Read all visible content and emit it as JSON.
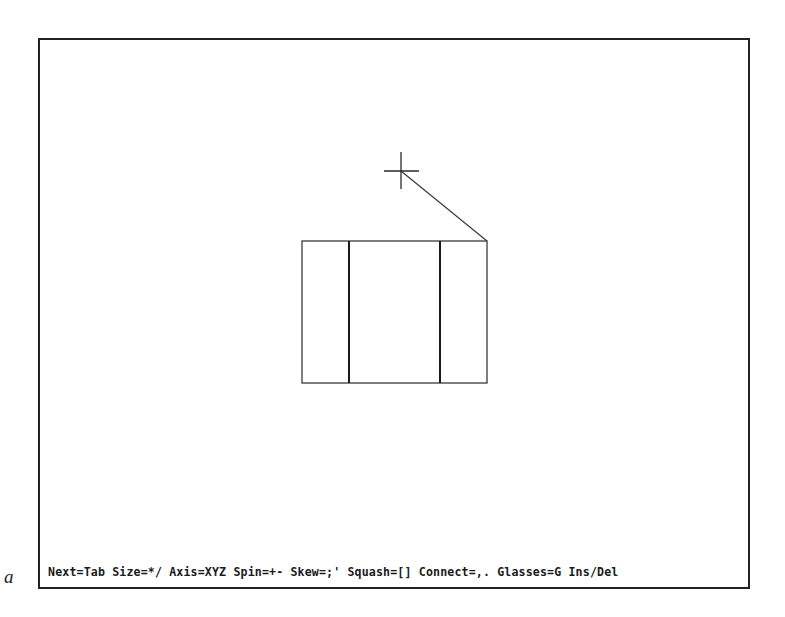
{
  "figure": {
    "label": "a"
  },
  "status_bar": {
    "text": "Next=Tab Size=*/ Axis=XYZ Spin=+- Skew=;' Squash=[] Connect=,. Glasses=G Ins/Del",
    "commands": [
      {
        "action": "Next",
        "keys": "Tab"
      },
      {
        "action": "Size",
        "keys": "*/"
      },
      {
        "action": "Axis",
        "keys": "XYZ"
      },
      {
        "action": "Spin",
        "keys": "+-"
      },
      {
        "action": "Skew",
        "keys": ";'"
      },
      {
        "action": "Squash",
        "keys": "[]"
      },
      {
        "action": "Connect",
        "keys": ",."
      },
      {
        "action": "Glasses",
        "keys": "G"
      },
      {
        "action": "Ins/Del",
        "keys": ""
      }
    ]
  },
  "scene": {
    "cursor": {
      "type": "crosshair",
      "x": 401,
      "y": 171
    },
    "connector_line": {
      "from": [
        401,
        171
      ],
      "to": [
        487,
        241
      ]
    },
    "box": {
      "left": 302,
      "top": 241,
      "right": 487,
      "bottom": 383,
      "inner_dividers_x": [
        349,
        440
      ]
    },
    "colors": {
      "stroke": "#333333",
      "background": "#ffffff"
    }
  }
}
